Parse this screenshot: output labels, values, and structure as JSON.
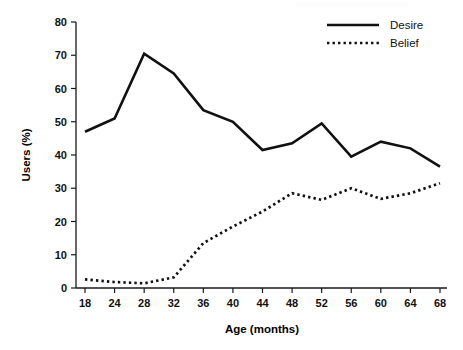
{
  "chart_data": {
    "type": "line",
    "title": "",
    "xlabel": "Age (months)",
    "ylabel": "Users (%)",
    "xlim": [
      18,
      68
    ],
    "ylim": [
      0,
      80
    ],
    "grid": false,
    "legend_position": "top-right",
    "x_tick_labels": [
      "18",
      "24",
      "28",
      "32",
      "36",
      "40",
      "44",
      "48",
      "52",
      "56",
      "60",
      "64",
      "68"
    ],
    "y_tick_labels": [
      "0",
      "10",
      "20",
      "30",
      "40",
      "50",
      "60",
      "70",
      "80"
    ],
    "x": [
      18,
      24,
      28,
      32,
      36,
      40,
      44,
      48,
      52,
      56,
      60,
      64,
      68
    ],
    "series": [
      {
        "name": "Desire",
        "style": "solid",
        "color": "#111111",
        "values": [
          47,
          51,
          70.5,
          64.5,
          53.5,
          50,
          41.5,
          43.5,
          49.5,
          39.5,
          44,
          42,
          36.5
        ]
      },
      {
        "name": "Belief",
        "style": "dotted",
        "color": "#111111",
        "values": [
          2.6,
          1.8,
          1.4,
          3.2,
          13.5,
          18.5,
          23,
          28.5,
          26.5,
          30,
          26.8,
          28.5,
          31.5
        ]
      }
    ]
  },
  "legend": {
    "entries": [
      {
        "label": "Desire",
        "style": "solid"
      },
      {
        "label": "Belief",
        "style": "dotted"
      }
    ]
  },
  "axes": {
    "y_title": "Users (%)",
    "x_title": "Age (months)"
  }
}
